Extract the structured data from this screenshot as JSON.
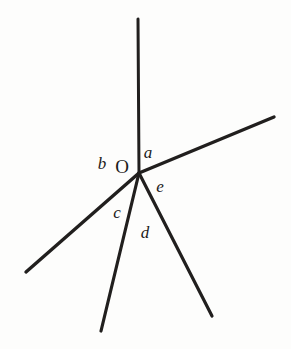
{
  "figure": {
    "background_color": "#fdfdfc",
    "stroke_color": "#211f1e",
    "label_color": "#1c1b1a",
    "width": 291,
    "height": 349
  },
  "chart_data": {
    "type": "diagram",
    "subtype": "geometric-angle-diagram",
    "title": "",
    "xlabel": "",
    "ylabel": "",
    "vertex": {
      "name": "O",
      "label": "O",
      "x": 139,
      "y": 173,
      "label_x": 122,
      "label_y": 166
    },
    "rays": [
      {
        "name": "ray-up",
        "from_x": 139,
        "from_y": 173,
        "to_x": 138,
        "to_y": 19,
        "stroke_width": 3.0,
        "direction_deg": 90
      },
      {
        "name": "ray-upper-right",
        "from_x": 139,
        "from_y": 173,
        "to_x": 274,
        "to_y": 117,
        "stroke_width": 3.4,
        "direction_deg": 22
      },
      {
        "name": "ray-lower-left",
        "from_x": 139,
        "from_y": 173,
        "to_x": 26,
        "to_y": 272,
        "stroke_width": 3.4,
        "direction_deg": 221
      },
      {
        "name": "ray-bottom-center",
        "from_x": 139,
        "from_y": 173,
        "to_x": 101,
        "to_y": 331,
        "stroke_width": 3.2,
        "direction_deg": 256
      },
      {
        "name": "ray-bottom-right",
        "from_x": 139,
        "from_y": 173,
        "to_x": 212,
        "to_y": 316,
        "stroke_width": 3.2,
        "direction_deg": 297
      }
    ],
    "angles": [
      {
        "label": "a",
        "x": 148,
        "y": 152,
        "between": [
          "ray-up",
          "ray-upper-right"
        ]
      },
      {
        "label": "b",
        "x": 102,
        "y": 163,
        "between": [
          "ray-lower-left",
          "ray-up"
        ]
      },
      {
        "label": "c",
        "x": 117,
        "y": 212,
        "between": [
          "ray-bottom-center",
          "ray-lower-left"
        ]
      },
      {
        "label": "d",
        "x": 145,
        "y": 232,
        "between": [
          "ray-bottom-right",
          "ray-bottom-center"
        ]
      },
      {
        "label": "e",
        "x": 160,
        "y": 186,
        "between": [
          "ray-upper-right",
          "ray-bottom-right"
        ]
      }
    ]
  }
}
